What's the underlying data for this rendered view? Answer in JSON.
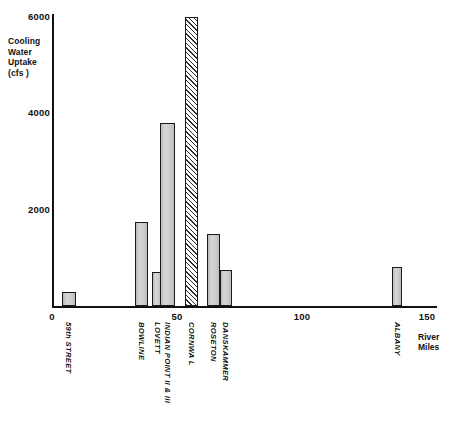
{
  "chart_data": {
    "type": "bar",
    "title": "",
    "subtitle": "",
    "ylabel": "Cooling\nWater\nUptake\n(cfs )",
    "xlabel": "River\nMiles",
    "xlim": [
      0,
      154
    ],
    "ylim": [
      0,
      6100
    ],
    "grid": false,
    "legend": null,
    "y_ticks": [
      {
        "value": 2000,
        "label": "2000"
      },
      {
        "value": 4000,
        "label": "4000"
      },
      {
        "value": 6000,
        "label": "6000"
      }
    ],
    "x_ticks": [
      {
        "value": 0,
        "label": "0"
      },
      {
        "value": 50,
        "label": "50"
      },
      {
        "value": 100,
        "label": "100"
      },
      {
        "value": 150,
        "label": "150"
      }
    ],
    "categories": [
      "59th STREET",
      "BOWLINE",
      "LOVETT",
      "INDIAN POINT II & III",
      "CORNWA L",
      "ROSETON",
      "DANSKAMMER",
      "ALBANY"
    ],
    "values": [
      300,
      1750,
      700,
      3800,
      6000,
      1500,
      750,
      800
    ],
    "x": [
      4,
      33,
      40,
      43,
      53,
      62,
      67,
      136
    ],
    "bars": [
      {
        "name": "59th STREET",
        "river_mile": 4,
        "value": 300,
        "style": "solid",
        "width_miles": 5.5
      },
      {
        "name": "BOWLINE",
        "river_mile": 33,
        "value": 1750,
        "style": "solid",
        "width_miles": 5.5
      },
      {
        "name": "LOVETT",
        "river_mile": 40,
        "value": 700,
        "style": "solid",
        "width_miles": 4.0
      },
      {
        "name": "INDIAN POINT II & III",
        "river_mile": 43,
        "value": 3800,
        "style": "solid",
        "width_miles": 6.0
      },
      {
        "name": "CORNWA L",
        "river_mile": 53,
        "value": 6000,
        "style": "hatched",
        "width_miles": 5.5
      },
      {
        "name": "ROSETON",
        "river_mile": 62,
        "value": 1500,
        "style": "solid",
        "width_miles": 5.0
      },
      {
        "name": "DANSKAMMER",
        "river_mile": 67,
        "value": 750,
        "style": "solid",
        "width_miles": 5.0
      },
      {
        "name": "ALBANY",
        "river_mile": 136,
        "value": 800,
        "style": "solid",
        "width_miles": 4.0
      }
    ]
  }
}
